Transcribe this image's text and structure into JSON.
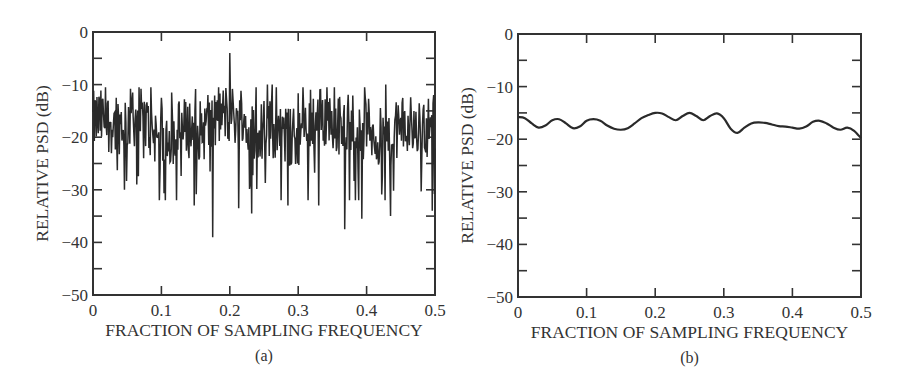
{
  "chart_data": [
    {
      "id": "a",
      "type": "line",
      "caption": "(a)",
      "title": "",
      "xlabel": "FRACTION OF SAMPLING FREQUENCY",
      "ylabel": "RELATIVE PSD (dB)",
      "xlim": [
        0,
        0.5
      ],
      "ylim": [
        -50,
        0
      ],
      "xticks": [
        0,
        0.1,
        0.2,
        0.3,
        0.4,
        0.5
      ],
      "xtick_labels": [
        "0",
        "0.1",
        "0.2",
        "0.3",
        "0.4",
        "0.5"
      ],
      "yticks": [
        0,
        -10,
        -20,
        -30,
        -40,
        -50
      ],
      "ytick_labels": [
        "0",
        "−10",
        "−20",
        "−30",
        "−40",
        "−50"
      ],
      "grid": false,
      "legend": null,
      "description": "Noisy periodogram fluctuating mostly between about -12 and -25 dB, with a sharp spectral line at 0.2",
      "baseline_db": -18,
      "noise_range_db": [
        -25,
        -12
      ],
      "notable_points": [
        {
          "x": 0.2,
          "y": -4,
          "label": "peak"
        },
        {
          "x": 0.175,
          "y": -39
        },
        {
          "x": 0.168,
          "y": -36
        },
        {
          "x": 0.232,
          "y": -34.5
        },
        {
          "x": 0.213,
          "y": -33.5
        },
        {
          "x": 0.148,
          "y": -33
        },
        {
          "x": 0.097,
          "y": -32
        },
        {
          "x": 0.285,
          "y": -33
        },
        {
          "x": 0.33,
          "y": -33
        },
        {
          "x": 0.368,
          "y": -37.5
        },
        {
          "x": 0.393,
          "y": -35.5
        },
        {
          "x": 0.435,
          "y": -35
        },
        {
          "x": 0.427,
          "y": -32
        },
        {
          "x": 0.375,
          "y": -32
        },
        {
          "x": 0.046,
          "y": -30
        },
        {
          "x": 0.064,
          "y": -29
        },
        {
          "x": 0.496,
          "y": -34
        },
        {
          "x": 0.255,
          "y": -10
        },
        {
          "x": 0.262,
          "y": -10
        },
        {
          "x": 0.268,
          "y": -10.5
        },
        {
          "x": 0.307,
          "y": -10.5
        },
        {
          "x": 0.318,
          "y": -11
        },
        {
          "x": 0.342,
          "y": -10.5
        },
        {
          "x": 0.428,
          "y": -10
        },
        {
          "x": 0.058,
          "y": -11.5
        },
        {
          "x": 0.034,
          "y": -12.5
        },
        {
          "x": 0.1,
          "y": -12.5
        },
        {
          "x": 0.115,
          "y": -11.5
        },
        {
          "x": 0.168,
          "y": -12
        }
      ]
    },
    {
      "id": "b",
      "type": "line",
      "caption": "(b)",
      "title": "",
      "xlabel": "FRACTION OF SAMPLING FREQUENCY",
      "ylabel": "RELATIVE PSD (dB)",
      "xlim": [
        0,
        0.5
      ],
      "ylim": [
        -50,
        0
      ],
      "xticks": [
        0,
        0.1,
        0.2,
        0.3,
        0.4,
        0.5
      ],
      "xtick_labels": [
        "0",
        "0.1",
        "0.2",
        "0.3",
        "0.4",
        "0.5"
      ],
      "yticks": [
        0,
        -10,
        -20,
        -30,
        -40,
        -50
      ],
      "ytick_labels": [
        "0",
        "−10",
        "−20",
        "−30",
        "−40",
        "−50"
      ],
      "grid": false,
      "legend": null,
      "x": [
        0,
        0.01,
        0.02,
        0.03,
        0.04,
        0.05,
        0.06,
        0.07,
        0.08,
        0.09,
        0.1,
        0.11,
        0.12,
        0.13,
        0.14,
        0.15,
        0.16,
        0.17,
        0.18,
        0.19,
        0.2,
        0.21,
        0.22,
        0.23,
        0.24,
        0.25,
        0.26,
        0.27,
        0.28,
        0.29,
        0.3,
        0.31,
        0.32,
        0.33,
        0.34,
        0.35,
        0.36,
        0.37,
        0.38,
        0.39,
        0.4,
        0.41,
        0.42,
        0.43,
        0.44,
        0.45,
        0.46,
        0.47,
        0.48,
        0.49,
        0.5
      ],
      "y": [
        -15.8,
        -16.0,
        -17.0,
        -17.8,
        -17.4,
        -16.4,
        -16.2,
        -17.0,
        -17.9,
        -17.6,
        -16.5,
        -16.2,
        -16.5,
        -17.4,
        -18.0,
        -18.2,
        -17.9,
        -17.0,
        -16.0,
        -15.4,
        -15.0,
        -15.1,
        -15.8,
        -16.4,
        -15.6,
        -15.0,
        -15.6,
        -16.4,
        -15.6,
        -15.1,
        -16.0,
        -18.0,
        -18.8,
        -17.8,
        -17.0,
        -16.8,
        -16.9,
        -17.2,
        -17.5,
        -17.6,
        -17.8,
        -18.0,
        -17.6,
        -16.7,
        -16.5,
        -17.0,
        -17.8,
        -18.2,
        -17.8,
        -18.4,
        -19.8
      ]
    }
  ],
  "style": {
    "ink_color": "#2a2a2a",
    "frame_color": "#333333",
    "background": "#ffffff"
  },
  "layout": {
    "a": {
      "left": 93,
      "top": 32,
      "right": 435,
      "bottom": 295
    },
    "b": {
      "left": 68,
      "top": 34,
      "right": 411,
      "bottom": 297
    }
  }
}
